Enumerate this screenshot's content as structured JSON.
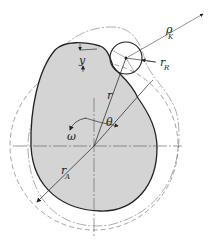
{
  "diagram": {
    "type": "cam-follower geometry",
    "colors": {
      "cam_fill": "#d4d4d4",
      "outline": "#222222",
      "thin_line": "#555555"
    },
    "labels": {
      "y": "y",
      "r": "r",
      "theta": "θ",
      "omega": "ω",
      "rA_main": "r",
      "rA_sub": "A",
      "rR_main": "r",
      "rR_sub": "R",
      "rho_main": "ρ",
      "rho_sub": "K"
    }
  }
}
